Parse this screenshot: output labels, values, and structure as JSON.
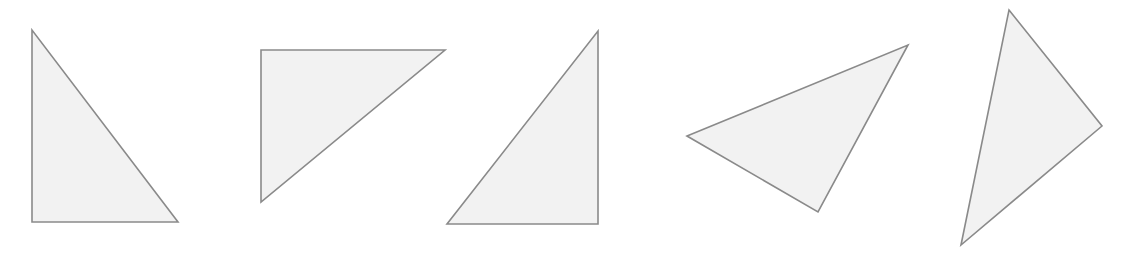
{
  "figure": {
    "background_color": "#ffffff",
    "width": 1129,
    "height": 263
  },
  "style": {
    "fill_color": "#f2f2f2",
    "stroke_color": "#8a8a8a",
    "stroke_width": 1.6
  },
  "shapes": [
    {
      "name": "triangle-1",
      "label": "Right triangle, vertical left leg, horizontal bottom leg, apex top-left",
      "orientation": "right-angle-bottom-left",
      "points": "32,30 32,222 178,222",
      "vertices": [
        [
          32,
          30
        ],
        [
          32,
          222
        ],
        [
          178,
          222
        ]
      ]
    },
    {
      "name": "triangle-2",
      "label": "Right triangle, horizontal top leg, vertical left leg, apex bottom-left",
      "orientation": "right-angle-top-left",
      "points": "261,50 445,50 261,202",
      "vertices": [
        [
          261,
          50
        ],
        [
          445,
          50
        ],
        [
          261,
          202
        ]
      ]
    },
    {
      "name": "triangle-3",
      "label": "Right triangle, vertical right leg, horizontal bottom leg, apex top-right",
      "orientation": "right-angle-bottom-right",
      "points": "598,31 598,224 447,224",
      "vertices": [
        [
          598,
          31
        ],
        [
          598,
          224
        ],
        [
          447,
          224
        ]
      ]
    },
    {
      "name": "triangle-4",
      "label": "Rotated scalene triangle pointing right and upward",
      "orientation": "rotated-scalene",
      "points": "687,136 908,45 818,212",
      "vertices": [
        [
          687,
          136
        ],
        [
          908,
          45
        ],
        [
          818,
          212
        ]
      ]
    },
    {
      "name": "triangle-5",
      "label": "Rotated scalene triangle, tall, apex at top",
      "orientation": "rotated-scalene",
      "points": "1009,10 1102,126 961,245",
      "vertices": [
        [
          1009,
          10
        ],
        [
          1102,
          126
        ],
        [
          961,
          245
        ]
      ]
    }
  ]
}
